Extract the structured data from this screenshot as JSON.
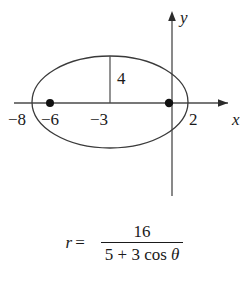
{
  "figure": {
    "type": "conic-section-diagram",
    "curve": "ellipse",
    "axes": {
      "x_label": "x",
      "y_label": "y",
      "x_axis_y_pixel": 103,
      "y_axis_x_pixel": 172
    },
    "x_tick_labels": [
      "−8",
      "−6",
      "−3",
      "2"
    ],
    "chord_label": "4",
    "foci_count": 2,
    "ellipse": {
      "center_x": -3,
      "center_y": 0,
      "semi_major": 5,
      "semi_minor": 4,
      "vertex_left": -8,
      "vertex_right": 2,
      "focus_left": -6,
      "focus_right": 0,
      "semi_latus_rectum": 3.2
    }
  },
  "equation": {
    "lhs": "r",
    "equals": "=",
    "numerator": "16",
    "denominator_prefix": "5 + 3 cos ",
    "denominator_theta": "θ"
  },
  "colors": {
    "ink": "#1a1a1a",
    "curve": "#3a3a3a",
    "background": "#ffffff"
  }
}
